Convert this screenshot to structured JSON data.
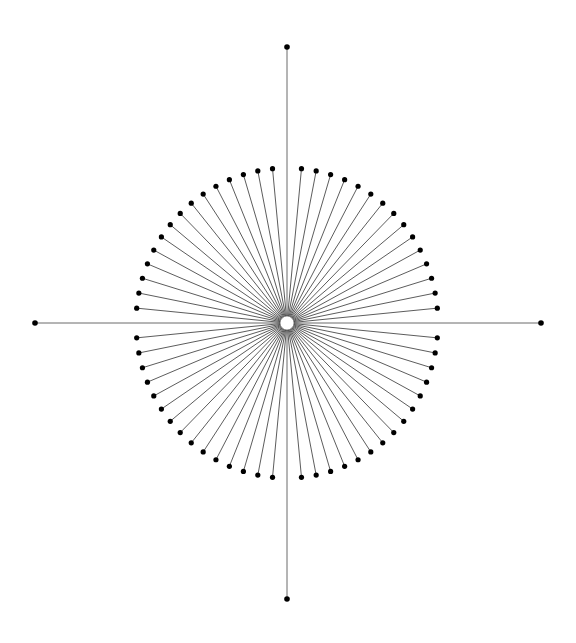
{
  "diagram": {
    "type": "radial-starburst",
    "canvas": {
      "width": 576,
      "height": 643,
      "background": "#ffffff"
    },
    "center": {
      "x": 287,
      "y": 323,
      "hub_radius": 7
    },
    "colors": {
      "ray": "#4a4a4a",
      "axis": "#6a6a6a",
      "dot": "#000000",
      "hub_fill": "#ffffff"
    },
    "ring": {
      "rx": 151,
      "ry": 155,
      "dots_per_quadrant": 15,
      "total_dots": 60,
      "first_angle_from_axis_deg": 5.5,
      "last_angle_from_axis_deg": 84.5,
      "dot_radius": 2.6
    },
    "axes": [
      {
        "name": "top",
        "x": 287,
        "y": 47
      },
      {
        "name": "bottom",
        "x": 287,
        "y": 599
      },
      {
        "name": "left",
        "x": 35,
        "y": 323
      },
      {
        "name": "right",
        "x": 541,
        "y": 323
      }
    ],
    "axis_dot_radius": 2.8
  }
}
